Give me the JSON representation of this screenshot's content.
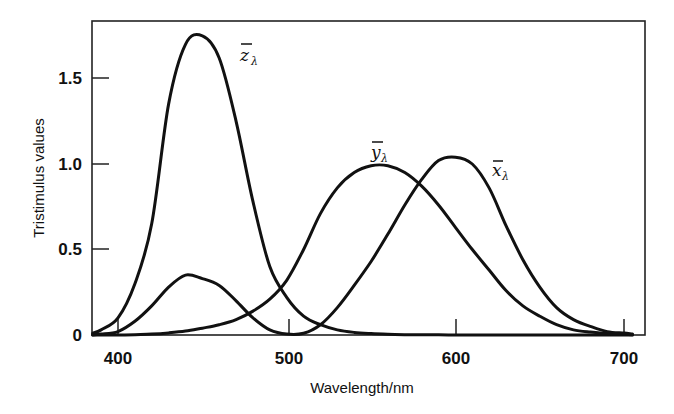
{
  "chart_data": {
    "type": "line",
    "title": "",
    "xlabel": "Wavelength/nm",
    "ylabel": "Tristimulus values",
    "xlim": [
      384,
      711
    ],
    "ylim": [
      0,
      1.84
    ],
    "grid": false,
    "legend_position": "inline labels next to curves",
    "x_ticks": [
      {
        "value": 400,
        "label": "400"
      },
      {
        "value": 500,
        "label": "500"
      },
      {
        "value": 600,
        "label": "600"
      },
      {
        "value": 700,
        "label": "700"
      }
    ],
    "y_ticks": [
      {
        "value": 0,
        "label": "0"
      },
      {
        "value": 0.5,
        "label": "0.5"
      },
      {
        "value": 1.0,
        "label": "1.0"
      },
      {
        "value": 1.5,
        "label": "1.5"
      }
    ],
    "x": [
      385,
      390,
      400,
      410,
      420,
      430,
      440,
      450,
      460,
      470,
      480,
      490,
      500,
      510,
      520,
      530,
      540,
      550,
      560,
      570,
      580,
      590,
      600,
      610,
      620,
      630,
      640,
      650,
      660,
      670,
      680,
      690,
      700,
      705
    ],
    "series": [
      {
        "name": "z̄λ",
        "label_main": "z",
        "label_sub": "λ",
        "values": [
          0.01,
          0.03,
          0.1,
          0.3,
          0.65,
          1.35,
          1.7,
          1.75,
          1.62,
          1.25,
          0.78,
          0.4,
          0.22,
          0.11,
          0.06,
          0.03,
          0.015,
          0.008,
          0.004,
          0.002,
          0.001,
          0.001,
          0.0,
          0.0,
          0.0,
          0.0,
          0.0,
          0.0,
          0.0,
          0.0,
          0.0,
          0.0,
          0.0,
          0.0
        ]
      },
      {
        "name": "ȳλ",
        "label_main": "y",
        "label_sub": "λ",
        "values": [
          0.0,
          0.0,
          0.0005,
          0.002,
          0.005,
          0.012,
          0.023,
          0.04,
          0.06,
          0.09,
          0.14,
          0.21,
          0.32,
          0.5,
          0.71,
          0.86,
          0.95,
          0.99,
          0.99,
          0.95,
          0.87,
          0.76,
          0.63,
          0.5,
          0.38,
          0.26,
          0.17,
          0.11,
          0.06,
          0.03,
          0.017,
          0.008,
          0.004,
          0.002
        ]
      },
      {
        "name": "x̄λ",
        "label_main": "x",
        "label_sub": "λ",
        "values": [
          0.0,
          0.005,
          0.02,
          0.08,
          0.17,
          0.28,
          0.35,
          0.33,
          0.29,
          0.2,
          0.1,
          0.03,
          0.005,
          0.01,
          0.06,
          0.16,
          0.29,
          0.43,
          0.59,
          0.76,
          0.91,
          1.02,
          1.04,
          1.0,
          0.86,
          0.64,
          0.44,
          0.28,
          0.16,
          0.09,
          0.05,
          0.02,
          0.011,
          0.005
        ]
      }
    ],
    "annotations": [
      {
        "text": "z̄λ",
        "near": "z̄λ peak, right side"
      },
      {
        "text": "ȳλ",
        "near": "ȳλ peak, above"
      },
      {
        "text": "x̄λ",
        "near": "x̄λ peak, right side"
      }
    ]
  },
  "labels": {
    "xlabel": "Wavelength/nm",
    "ylabel": "Tristimulus values",
    "x_ticks": [
      "400",
      "500",
      "600",
      "700"
    ],
    "y_ticks": [
      "0",
      "0.5",
      "1.0",
      "1.5"
    ],
    "curve_z_main": "z",
    "curve_y_main": "y",
    "curve_x_main": "x",
    "curve_sub": "λ"
  },
  "colors": {
    "line": "#111111",
    "background": "#ffffff"
  }
}
